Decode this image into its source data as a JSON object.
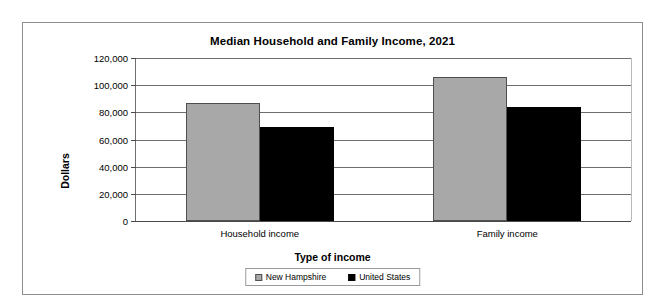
{
  "chart_data": {
    "type": "bar",
    "title": "Median Household and Family Income, 2021",
    "xlabel": "Type of income",
    "ylabel": "Dollars",
    "categories": [
      "Household income",
      "Family income"
    ],
    "series": [
      {
        "name": "New Hampshire",
        "color": "#a8a8a8",
        "values": [
          87000,
          106000
        ]
      },
      {
        "name": "United States",
        "color": "#000000",
        "values": [
          69000,
          84000
        ]
      }
    ],
    "ylim": [
      0,
      120000
    ],
    "ytick_labels": [
      "120,000",
      "100,000",
      "80,000",
      "60,000",
      "40,000",
      "20,000",
      "0"
    ],
    "ytick_values": [
      120000,
      100000,
      80000,
      60000,
      40000,
      20000,
      0
    ],
    "grid": true,
    "legend_position": "bottom"
  }
}
